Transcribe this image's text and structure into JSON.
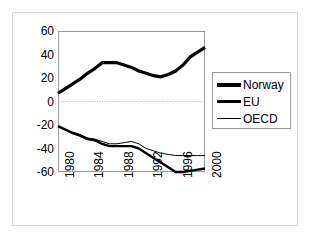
{
  "chart_data": {
    "type": "line",
    "title": "",
    "subtitle": "",
    "xlabel": "",
    "ylabel": "",
    "x": [
      1980,
      1981,
      1982,
      1983,
      1984,
      1985,
      1986,
      1987,
      1988,
      1989,
      1990,
      1991,
      1992,
      1993,
      1994,
      1995,
      1996,
      1997,
      1998,
      1999,
      2000
    ],
    "xlim": [
      1980,
      2000
    ],
    "ylim": [
      -60,
      60
    ],
    "xticks": [
      1980,
      1984,
      1988,
      1992,
      1996,
      2000
    ],
    "xticklabels": [
      "1980",
      "1984",
      "1988",
      "1992",
      "1996",
      "2000"
    ],
    "yticks": [
      -60,
      -40,
      -20,
      0,
      20,
      40,
      60
    ],
    "yticklabels": [
      "60",
      "40",
      "20",
      "0",
      "-20",
      "-40",
      "-60"
    ],
    "grid": "zero-line-only",
    "legend_position": "right",
    "series": [
      {
        "name": "Norway",
        "style": "thick",
        "color": "#000000",
        "values": [
          7,
          11,
          15,
          19,
          24,
          28,
          33,
          33,
          33,
          31,
          29,
          26,
          24,
          22,
          21,
          23,
          26,
          31,
          38,
          42,
          46
        ]
      },
      {
        "name": "EU",
        "style": "medium",
        "color": "#000000",
        "values": [
          -21,
          -24,
          -27,
          -29,
          -32,
          -33,
          -36,
          -38,
          -38,
          -38,
          -38,
          -40,
          -44,
          -48,
          -52,
          -56,
          -60,
          -60,
          -59,
          -58,
          -57
        ]
      },
      {
        "name": "OECD",
        "style": "thin",
        "color": "#000000",
        "values": [
          -21,
          -24,
          -26,
          -28,
          -31,
          -32,
          -34,
          -36,
          -36,
          -35,
          -34,
          -36,
          -40,
          -42,
          -44,
          -45,
          -46,
          -46,
          -46,
          -46,
          -46
        ]
      }
    ]
  },
  "legend": {
    "items": [
      {
        "label": "Norway",
        "swatch": "thick-line-icon"
      },
      {
        "label": "EU",
        "swatch": "medium-line-icon"
      },
      {
        "label": "OECD",
        "swatch": "thin-line-icon"
      }
    ]
  },
  "axes": {
    "y_labels": [
      "60",
      "40",
      "20",
      "0",
      "-20",
      "-40",
      "-60"
    ],
    "x_labels": [
      "1980",
      "1984",
      "1988",
      "1992",
      "1996",
      "2000"
    ]
  }
}
